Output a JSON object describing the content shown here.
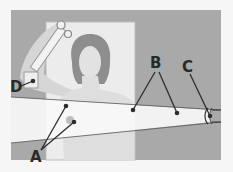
{
  "figure": {
    "colors": {
      "page_bg": "#f6f6f6",
      "panel_bg": "#a9a9a9",
      "backdrop": "#ececec",
      "beam": "#f8f8f8",
      "skin": "#dcdcdc",
      "hair": "#8e8e8e",
      "line": "#2e2e2e"
    },
    "labels": [
      {
        "id": "A",
        "text": "A",
        "x": 30,
        "y": 160,
        "points": [
          [
            66,
            106
          ],
          [
            74,
            122
          ]
        ]
      },
      {
        "id": "B",
        "text": "B",
        "x": 150,
        "y": 68,
        "points": [
          [
            133,
            110
          ],
          [
            177,
            113
          ]
        ]
      },
      {
        "id": "C",
        "text": "C",
        "x": 182,
        "y": 72,
        "points": [
          [
            210,
            116
          ]
        ]
      },
      {
        "id": "D",
        "text": "D",
        "x": 10,
        "y": 92,
        "points": [
          [
            33,
            81
          ]
        ]
      }
    ]
  }
}
